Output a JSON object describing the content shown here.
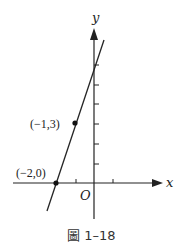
{
  "figure": {
    "caption_prefix": "圖",
    "caption_number": "1–18",
    "axes": {
      "x_label": "x",
      "y_label": "y",
      "origin_label": "O"
    },
    "points": [
      {
        "label": "(−2,0)",
        "x": -2,
        "y": 0
      },
      {
        "label": "(−1,3)",
        "x": -1,
        "y": 3
      }
    ],
    "line": {
      "equation": "y = 3x + 6",
      "slope": 3,
      "y_intercept": 6
    },
    "colors": {
      "ink": "#222222",
      "background": "#ffffff"
    }
  }
}
